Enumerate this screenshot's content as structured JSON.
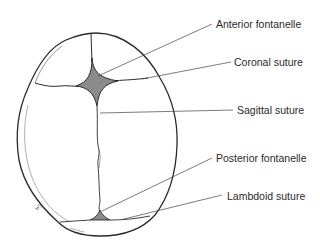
{
  "diagram": {
    "colors": {
      "outline": "#2a2a2a",
      "fontanelle_fill": "#8a8a8a",
      "leader_line": "#444444",
      "label_text": "#2a2a2a"
    },
    "labels": [
      {
        "id": "anterior-fontanelle",
        "text": "Anterior fontanelle"
      },
      {
        "id": "coronal-suture",
        "text": "Coronal suture"
      },
      {
        "id": "sagittal-suture",
        "text": "Sagittal suture"
      },
      {
        "id": "posterior-fontanelle",
        "text": "Posterior fontanelle"
      },
      {
        "id": "lambdoid-suture",
        "text": "Lambdoid suture"
      }
    ],
    "signature": "wy"
  }
}
